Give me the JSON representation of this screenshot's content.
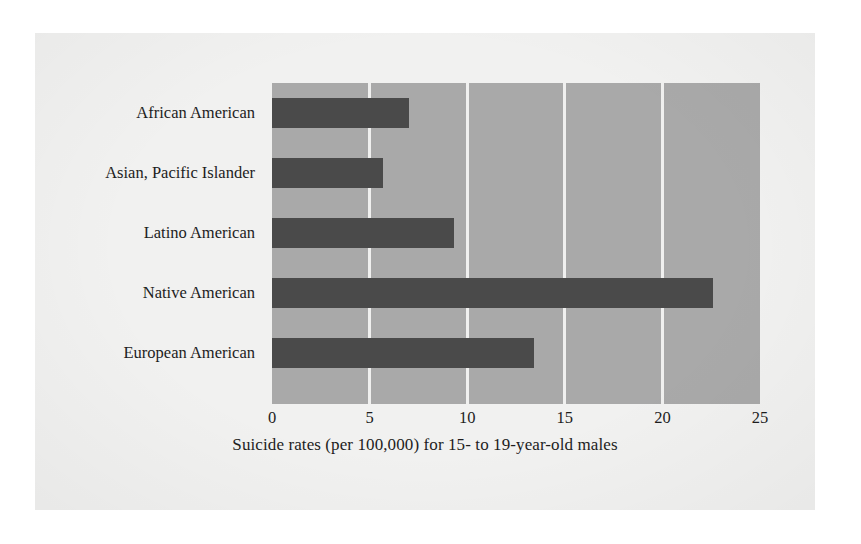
{
  "chart_data": {
    "type": "bar",
    "orientation": "horizontal",
    "title": "",
    "xlabel": "Suicide rates (per 100,000) for 15- to 19-year-old males",
    "ylabel": "",
    "categories": [
      "African American",
      "Asian, Pacific Islander",
      "Latino American",
      "Native American",
      "European American"
    ],
    "values": [
      7.0,
      5.7,
      9.3,
      22.6,
      13.4
    ],
    "xlim": [
      0,
      25
    ],
    "xticks": [
      0,
      5,
      10,
      15,
      20,
      25
    ],
    "xtick_labels": [
      "0",
      "5",
      "10",
      "15",
      "20",
      "25"
    ],
    "grid": "vertical-only",
    "legend": "none",
    "colors": {
      "bar": "#4a4a4a",
      "plot_background": "#a9a9a9",
      "gridline": "#f0f0ef",
      "page_background": "#f1f1f0",
      "text": "#1d1d1d"
    }
  }
}
